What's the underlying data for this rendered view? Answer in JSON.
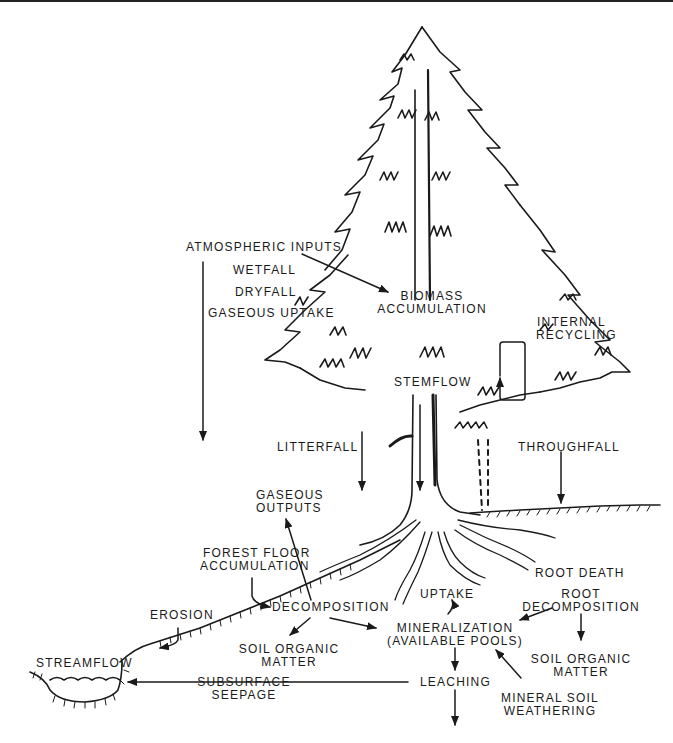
{
  "diagram": {
    "colors": {
      "ink": "#1a1a1a",
      "background": "#ffffff"
    },
    "labels": {
      "atmospheric_inputs": "ATMOSPHERIC INPUTS",
      "wetfall": "WETFALL",
      "dryfall": "DRYFALL",
      "gaseous_uptake": "GASEOUS UPTAKE",
      "biomass_1": "BIOMASS",
      "biomass_2": "ACCUMULATION",
      "internal_1": "INTERNAL",
      "internal_2": "RECYCLING",
      "stemflow": "STEMFLOW",
      "litterfall": "LITTERFALL",
      "throughfall": "THROUGHFALL",
      "gaseous_outputs_1": "GASEOUS",
      "gaseous_outputs_2": "OUTPUTS",
      "forest_floor_1": "FOREST FLOOR",
      "forest_floor_2": "ACCUMULATION",
      "root_death": "ROOT DEATH",
      "uptake": "UPTAKE",
      "root_decomp_1": "ROOT",
      "root_decomp_2": "DECOMPOSITION",
      "erosion": "EROSION",
      "decomposition": "DECOMPOSITION",
      "mineralization_1": "MINERALIZATION",
      "mineralization_2": "(AVAILABLE POOLS)",
      "soil_om_left_1": "SOIL ORGANIC",
      "soil_om_left_2": "MATTER",
      "soil_om_right_1": "SOIL ORGANIC",
      "soil_om_right_2": "MATTER",
      "streamflow": "STREAMFLOW",
      "subsurface_1": "SUBSURFACE",
      "subsurface_2": "SEEPAGE",
      "leaching": "LEACHING",
      "mineral_soil_1": "MINERAL SOIL",
      "mineral_soil_2": "WEATHERING"
    }
  }
}
